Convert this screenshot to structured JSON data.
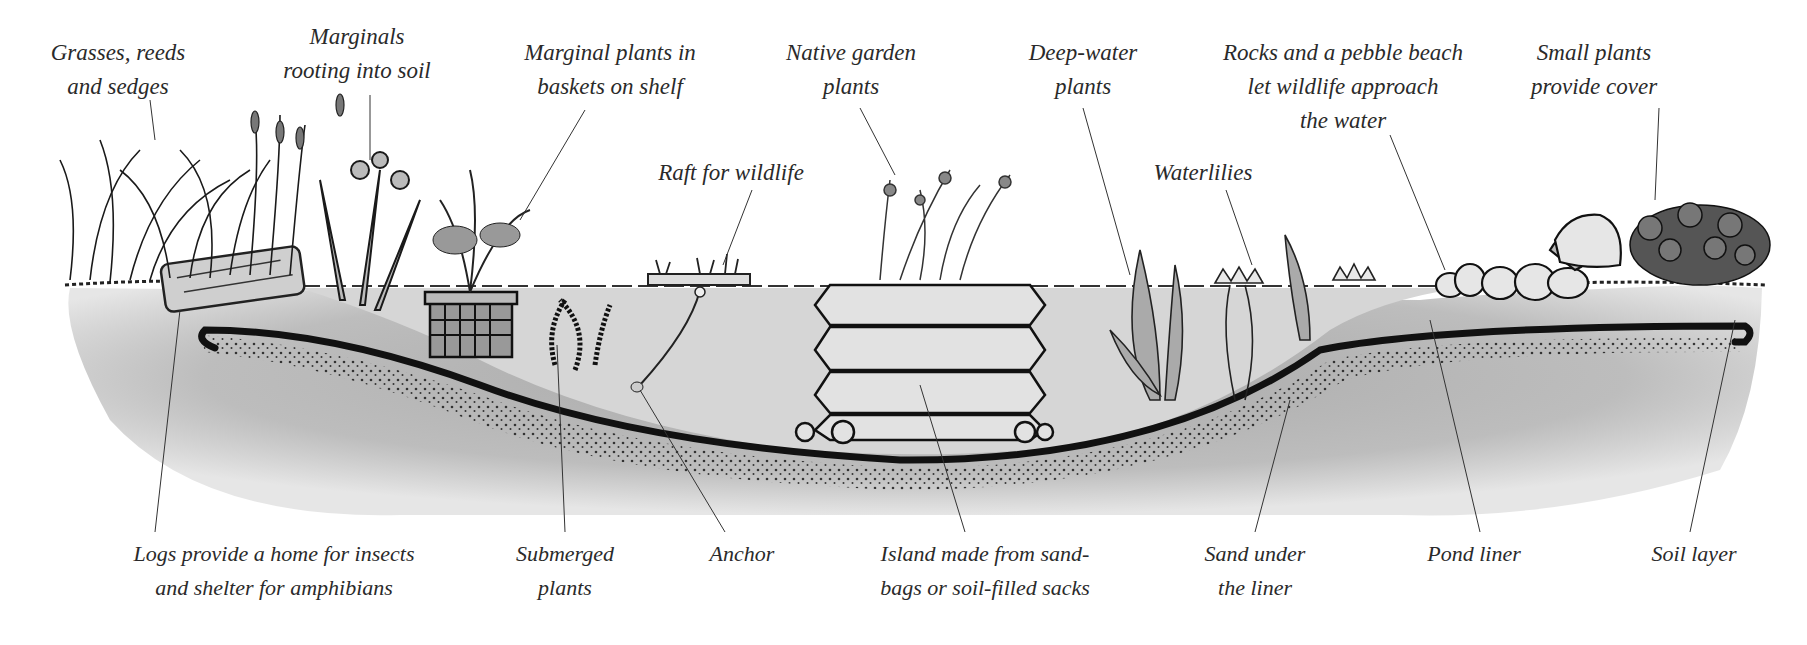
{
  "diagram": {
    "colors": {
      "background": "#ffffff",
      "soil": "#bdbdbd",
      "soil_dark": "#9e9e9e",
      "water": "#d2d2d2",
      "liner": "#111111",
      "ink": "#222222",
      "label_text": "#2a2a2a"
    },
    "top_labels": [
      {
        "id": "grasses",
        "lines": [
          "Grasses, reeds",
          "and sedges"
        ]
      },
      {
        "id": "marginals-rooting",
        "lines": [
          "Marginals",
          "rooting into soil"
        ]
      },
      {
        "id": "marginal-baskets",
        "lines": [
          "Marginal plants in",
          "baskets on shelf"
        ]
      },
      {
        "id": "native-garden",
        "lines": [
          "Native garden",
          "plants"
        ]
      },
      {
        "id": "deep-water",
        "lines": [
          "Deep-water",
          "plants"
        ]
      },
      {
        "id": "rocks-beach",
        "lines": [
          "Rocks and a pebble beach",
          "let wildlife approach",
          "the water"
        ]
      },
      {
        "id": "small-plants",
        "lines": [
          "Small plants",
          "provide cover"
        ]
      },
      {
        "id": "raft",
        "lines": [
          "Raft for wildlife"
        ]
      },
      {
        "id": "waterlilies",
        "lines": [
          "Waterlilies"
        ]
      }
    ],
    "bottom_labels": [
      {
        "id": "logs",
        "lines": [
          "Logs provide a home for insects",
          "and shelter for amphibians"
        ]
      },
      {
        "id": "submerged",
        "lines": [
          "Submerged",
          "plants"
        ]
      },
      {
        "id": "anchor",
        "lines": [
          "Anchor"
        ]
      },
      {
        "id": "island",
        "lines": [
          "Island made from sand-",
          "bags or soil-filled sacks"
        ]
      },
      {
        "id": "sand",
        "lines": [
          "Sand under",
          "the liner"
        ]
      },
      {
        "id": "liner",
        "lines": [
          "Pond liner"
        ]
      },
      {
        "id": "soil",
        "lines": [
          "Soil layer"
        ]
      }
    ]
  }
}
